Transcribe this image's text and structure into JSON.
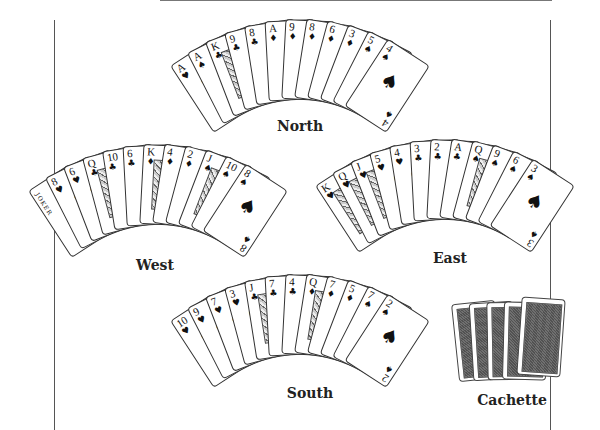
{
  "hands": {
    "north": {
      "label": "North",
      "cards": [
        {
          "rank": "A",
          "suit": "♥"
        },
        {
          "rank": "A",
          "suit": "♠"
        },
        {
          "rank": "K",
          "suit": "♣",
          "face": true
        },
        {
          "rank": "9",
          "suit": "♣"
        },
        {
          "rank": "8",
          "suit": "♣"
        },
        {
          "rank": "A",
          "suit": "♦"
        },
        {
          "rank": "9",
          "suit": "♦"
        },
        {
          "rank": "8",
          "suit": "♦"
        },
        {
          "rank": "6",
          "suit": "♦"
        },
        {
          "rank": "3",
          "suit": "♦"
        },
        {
          "rank": "5",
          "suit": "♠"
        },
        {
          "rank": "4",
          "suit": "♠"
        }
      ]
    },
    "west": {
      "label": "West",
      "cards": [
        {
          "rank": "",
          "suit": "",
          "joker": "JOKER"
        },
        {
          "rank": "8",
          "suit": "♥"
        },
        {
          "rank": "6",
          "suit": "♥"
        },
        {
          "rank": "Q",
          "suit": "♣",
          "face": true
        },
        {
          "rank": "10",
          "suit": "♣"
        },
        {
          "rank": "6",
          "suit": "♣"
        },
        {
          "rank": "K",
          "suit": "♦",
          "face": true
        },
        {
          "rank": "4",
          "suit": "♦"
        },
        {
          "rank": "2",
          "suit": "♦"
        },
        {
          "rank": "J",
          "suit": "♠",
          "face": true
        },
        {
          "rank": "10",
          "suit": "♠"
        },
        {
          "rank": "8",
          "suit": "♠"
        }
      ]
    },
    "east": {
      "label": "East",
      "cards": [
        {
          "rank": "K",
          "suit": "♥",
          "face": true
        },
        {
          "rank": "Q",
          "suit": "♥",
          "face": true
        },
        {
          "rank": "J",
          "suit": "♥",
          "face": true
        },
        {
          "rank": "5",
          "suit": "♥"
        },
        {
          "rank": "4",
          "suit": "♥"
        },
        {
          "rank": "3",
          "suit": "♣"
        },
        {
          "rank": "2",
          "suit": "♣"
        },
        {
          "rank": "A",
          "suit": "♣"
        },
        {
          "rank": "Q",
          "suit": "♠",
          "face": true
        },
        {
          "rank": "9",
          "suit": "♠"
        },
        {
          "rank": "6",
          "suit": "♠"
        },
        {
          "rank": "3",
          "suit": "♠"
        }
      ]
    },
    "south": {
      "label": "South",
      "cards": [
        {
          "rank": "10",
          "suit": "♥"
        },
        {
          "rank": "9",
          "suit": "♥"
        },
        {
          "rank": "7",
          "suit": "♥"
        },
        {
          "rank": "3",
          "suit": "♥"
        },
        {
          "rank": "J",
          "suit": "♣",
          "face": true
        },
        {
          "rank": "7",
          "suit": "♣"
        },
        {
          "rank": "4",
          "suit": "♣"
        },
        {
          "rank": "Q",
          "suit": "♦",
          "face": true
        },
        {
          "rank": "7",
          "suit": "♦"
        },
        {
          "rank": "5",
          "suit": "♦"
        },
        {
          "rank": "7",
          "suit": "♠"
        },
        {
          "rank": "2",
          "suit": "♠"
        }
      ]
    }
  },
  "cachette": {
    "label": "Cachette",
    "count": 5
  }
}
